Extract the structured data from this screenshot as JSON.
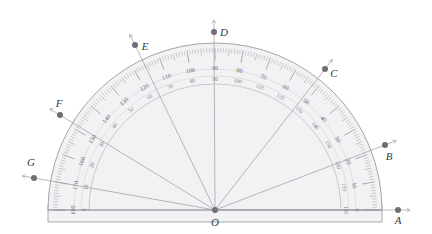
{
  "figure": {
    "type": "protractor-geometry-figure",
    "center_label": "O",
    "background": "#ffffff",
    "body_fill": "#f2f2f4",
    "body_stroke": "#9a9aa0",
    "tick_color": "#8b8b92",
    "ray_color": "#9b9ba2",
    "point_color": "#6e6e76",
    "label_color": "#3a3a3a"
  },
  "protractor": {
    "center": {
      "x": 215,
      "y": 210
    },
    "radius": 163,
    "inner_radius": 126,
    "base": {
      "left_x": 48,
      "right_x": 382,
      "top_y": 205,
      "bottom_y": 222
    },
    "scales": {
      "outer_labels": [
        "0",
        "10",
        "20",
        "30",
        "40",
        "50",
        "60",
        "70",
        "80",
        "90",
        "100",
        "110",
        "120",
        "130",
        "140",
        "150",
        "160",
        "170",
        "180"
      ],
      "inner_labels": [
        "180",
        "170",
        "160",
        "150",
        "140",
        "130",
        "120",
        "110",
        "100",
        "90",
        "80",
        "70",
        "60",
        "50",
        "40",
        "30",
        "20",
        "10",
        "0"
      ]
    }
  },
  "points": [
    {
      "id": "A",
      "label": "A",
      "angle_deg": 0,
      "px": 398,
      "py": 210,
      "label_x": 398,
      "label_y": 224,
      "ray": true
    },
    {
      "id": "B",
      "label": "B",
      "angle_deg": 20,
      "px": 385,
      "py": 145,
      "label_x": 389,
      "label_y": 160,
      "ray": true
    },
    {
      "id": "C",
      "label": "C",
      "angle_deg": 50,
      "px": 325,
      "py": 69,
      "label_x": 334,
      "label_y": 77,
      "ray": true
    },
    {
      "id": "D",
      "label": "D",
      "angle_deg": 90,
      "px": 214,
      "py": 32,
      "label_x": 224,
      "label_y": 36,
      "ray": true
    },
    {
      "id": "E",
      "label": "E",
      "angle_deg": 115,
      "px": 135,
      "py": 45,
      "label_x": 145,
      "label_y": 50,
      "ray": true
    },
    {
      "id": "F",
      "label": "F",
      "angle_deg": 148,
      "px": 60,
      "py": 115,
      "label_x": 59,
      "label_y": 107,
      "ray": true
    },
    {
      "id": "G",
      "label": "G",
      "angle_deg": 169,
      "px": 34,
      "py": 178,
      "label_x": 31,
      "label_y": 166,
      "ray": true
    }
  ],
  "center_point": {
    "label": "O",
    "label_x": 215,
    "label_y": 226
  }
}
